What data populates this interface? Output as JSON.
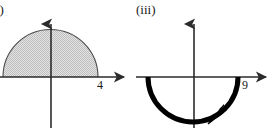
{
  "page": {
    "background_color": "#ffffff",
    "width": 273,
    "height": 128
  },
  "figures": [
    {
      "label": "i)",
      "label_full": "(ii)",
      "name": "upper-semicircle-shaded",
      "description": "Shaded upper half-disc resting on the horizontal axis",
      "axes": {
        "horizontal": {
          "arrow": true,
          "y": 77,
          "x_start": 0,
          "x_end": 130
        },
        "vertical": {
          "arrow": true,
          "x": 51,
          "y_start": 18,
          "y_end": 128
        }
      },
      "shape": {
        "type": "semicircle",
        "orientation": "upper",
        "center_x": 50.5,
        "center_y": 77,
        "radius": 47.5,
        "fill": "#d9d9d9",
        "fill_pattern": "stipple",
        "stroke": "#3a3a3a",
        "stroke_width": 1
      },
      "tick_label": "4",
      "tick_label_color": "#1a1a1a"
    },
    {
      "label": "(iii)",
      "label_full": "(iii)",
      "name": "lower-semicircle-arc",
      "description": "Thick lower semicircular arc below the horizontal axis with a directional arrowhead",
      "axes": {
        "horizontal": {
          "arrow": true,
          "y": 77,
          "x_start": 0,
          "x_end": 136
        },
        "vertical": {
          "arrow": true,
          "x": 58,
          "y_start": 18,
          "y_end": 128
        }
      },
      "shape": {
        "type": "arc",
        "orientation": "lower",
        "center_x": 57,
        "center_y": 77,
        "radius": 45,
        "fill": "none",
        "stroke": "#000000",
        "stroke_width": 5,
        "direction": "clockwise",
        "arrowhead": {
          "present": true,
          "x": 80,
          "y": 118,
          "angle_deg": -35
        }
      },
      "tick_label": "9",
      "tick_label_color": "#1a1a1a"
    }
  ],
  "colors": {
    "axis": "#2b2b2b",
    "curve_light": "#3a3a3a",
    "curve_heavy": "#000000",
    "shading": "#d9d9d9",
    "text": "#1a1a1a",
    "background": "#ffffff"
  }
}
